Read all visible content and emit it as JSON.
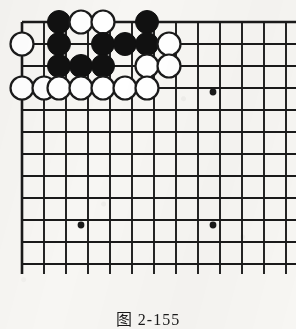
{
  "figure": {
    "kind": "go-board-diagram",
    "caption": "图 2-155",
    "caption_label": "图",
    "caption_number": "2-155",
    "background_color": "#f7f6f3",
    "line_color": "#1a1a1a",
    "black_stone_color": "#111111",
    "white_stone_color": "#ffffff"
  },
  "board": {
    "origin_x": 22,
    "origin_y": 22,
    "spacing": 22,
    "cols": 13,
    "rows": 12,
    "edges": {
      "top": true,
      "left": true,
      "right": false,
      "bottom": false
    },
    "overhang": 10,
    "star_points": [
      {
        "col": 9,
        "row": 3,
        "x": 213,
        "y": 92
      },
      {
        "col": 3,
        "row": 9,
        "x": 81,
        "y": 225
      },
      {
        "col": 9,
        "row": 9,
        "x": 213,
        "y": 225
      }
    ],
    "stones": [
      {
        "color": "black",
        "col": 2,
        "row": 0,
        "x": 59,
        "y": 22
      },
      {
        "color": "white",
        "col": 3,
        "row": 0,
        "x": 81,
        "y": 22
      },
      {
        "color": "white",
        "col": 4,
        "row": 0,
        "x": 103,
        "y": 22
      },
      {
        "color": "black",
        "col": 6,
        "row": 0,
        "x": 147,
        "y": 22
      },
      {
        "color": "white",
        "col": 0,
        "row": 1,
        "x": 22,
        "y": 44
      },
      {
        "color": "black",
        "col": 2,
        "row": 1,
        "x": 59,
        "y": 44
      },
      {
        "color": "black",
        "col": 4,
        "row": 1,
        "x": 103,
        "y": 44
      },
      {
        "color": "black",
        "col": 5,
        "row": 1,
        "x": 125,
        "y": 44
      },
      {
        "color": "black",
        "col": 6,
        "row": 1,
        "x": 147,
        "y": 44
      },
      {
        "color": "white",
        "col": 7,
        "row": 1,
        "x": 169,
        "y": 44
      },
      {
        "color": "black",
        "col": 2,
        "row": 2,
        "x": 59,
        "y": 66
      },
      {
        "color": "black",
        "col": 3,
        "row": 2,
        "x": 81,
        "y": 66
      },
      {
        "color": "black",
        "col": 4,
        "row": 2,
        "x": 103,
        "y": 66
      },
      {
        "color": "white",
        "col": 6,
        "row": 2,
        "x": 147,
        "y": 66
      },
      {
        "color": "white",
        "col": 7,
        "row": 2,
        "x": 169,
        "y": 66
      },
      {
        "color": "white",
        "col": 0,
        "row": 3,
        "x": 22,
        "y": 88
      },
      {
        "color": "white",
        "col": 1,
        "row": 3,
        "x": 44,
        "y": 88
      },
      {
        "color": "white",
        "col": 2,
        "row": 3,
        "x": 59,
        "y": 88
      },
      {
        "color": "white",
        "col": 3,
        "row": 3,
        "x": 81,
        "y": 88
      },
      {
        "color": "white",
        "col": 4,
        "row": 3,
        "x": 103,
        "y": 88
      },
      {
        "color": "white",
        "col": 5,
        "row": 3,
        "x": 125,
        "y": 88
      },
      {
        "color": "white",
        "col": 6,
        "row": 3,
        "x": 147,
        "y": 88
      }
    ],
    "stone_radius": 11.5
  }
}
